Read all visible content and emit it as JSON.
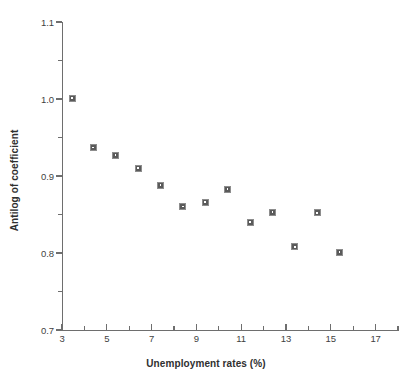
{
  "chart_data": {
    "type": "scatter",
    "title": "",
    "xlabel": "Unemployment rates (%)",
    "ylabel": "Antilog of coefficient",
    "xlim": [
      3,
      18
    ],
    "ylim": [
      0.7,
      1.1
    ],
    "grid": false,
    "legend": null,
    "x_major_ticks": [
      3,
      5,
      7,
      9,
      11,
      13,
      15,
      17
    ],
    "x_minor_ticks": [
      4,
      6,
      8,
      10,
      12,
      14,
      16,
      18
    ],
    "x_tick_labels": [
      "3",
      "5",
      "7",
      "9",
      "11",
      "13",
      "15",
      "17"
    ],
    "y_major_ticks": [
      0.7,
      0.8,
      0.9,
      1.0,
      1.1
    ],
    "y_minor_ticks": [
      0.75,
      0.85,
      0.95,
      1.05
    ],
    "y_tick_labels": [
      "0.7",
      "0.8",
      "0.9",
      "1.0",
      "1.1"
    ],
    "marker_style": "square",
    "marker_color": "#5a5a5a",
    "x": [
      3.45,
      4.4,
      5.4,
      6.4,
      7.4,
      8.4,
      9.4,
      10.4,
      11.4,
      12.4,
      13.4,
      14.4,
      15.4
    ],
    "y": [
      1.001,
      0.937,
      0.927,
      0.91,
      0.888,
      0.86,
      0.866,
      0.883,
      0.84,
      0.853,
      0.808,
      0.852,
      0.801
    ],
    "points": [
      {
        "x": 3.45,
        "y": 1.001
      },
      {
        "x": 4.4,
        "y": 0.937
      },
      {
        "x": 5.4,
        "y": 0.927
      },
      {
        "x": 6.4,
        "y": 0.91
      },
      {
        "x": 7.4,
        "y": 0.888
      },
      {
        "x": 8.4,
        "y": 0.86
      },
      {
        "x": 9.4,
        "y": 0.866
      },
      {
        "x": 10.4,
        "y": 0.883
      },
      {
        "x": 11.4,
        "y": 0.84
      },
      {
        "x": 12.4,
        "y": 0.853
      },
      {
        "x": 13.4,
        "y": 0.808
      },
      {
        "x": 14.4,
        "y": 0.852
      },
      {
        "x": 15.4,
        "y": 0.801
      }
    ]
  },
  "caption_fragment": ""
}
